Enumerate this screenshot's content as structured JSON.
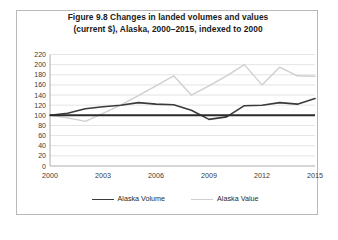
{
  "figure": {
    "title_line1": "Figure 9.8 Changes in landed volumes and values",
    "title_line2": "(current $), Alaska, 2000–2015, indexed to 2000"
  },
  "colors": {
    "volume_line": "#3b3b3b",
    "value_line": "#cfcfcf",
    "baseline": "#2b2b2b",
    "gridline": "#d8d8d8",
    "axis": "#9a9a9a",
    "frame": "#b9b9b9",
    "text": "#2a2a2a"
  },
  "legend": {
    "position": "bottom",
    "items": [
      {
        "label": "Alaska Volume",
        "color": "#3b3b3b",
        "width": 1.6
      },
      {
        "label": "Alaska Value",
        "color": "#cfcfcf",
        "width": 1.6
      }
    ]
  },
  "chart_data": {
    "type": "line",
    "title": "Figure 9.8 Changes in landed volumes and values (current $), Alaska, 2000–2015, indexed to 2000",
    "xlabel": "",
    "ylabel": "",
    "x": [
      2000,
      2001,
      2002,
      2003,
      2004,
      2005,
      2006,
      2007,
      2008,
      2009,
      2010,
      2011,
      2012,
      2013,
      2014,
      2015
    ],
    "xlim": [
      2000,
      2015
    ],
    "xticks": [
      2000,
      2003,
      2006,
      2009,
      2012,
      2015
    ],
    "xtick_labels": [
      "2000",
      "2003",
      "2006",
      "2009",
      "2012",
      "2015"
    ],
    "ylim": [
      0,
      220
    ],
    "yticks": [
      0,
      20,
      40,
      60,
      80,
      100,
      120,
      140,
      160,
      180,
      200,
      220
    ],
    "ytick_labels": [
      "0",
      "20",
      "40",
      "60",
      "80",
      "100",
      "120",
      "140",
      "160",
      "180",
      "200",
      "220"
    ],
    "grid": true,
    "reference_line": 100,
    "series": [
      {
        "name": "Alaska Volume",
        "color": "#3b3b3b",
        "values": [
          100,
          104,
          113,
          117,
          120,
          125,
          122,
          121,
          110,
          92,
          97,
          119,
          120,
          125,
          122,
          133
        ]
      },
      {
        "name": "Alaska Value",
        "color": "#cfcfcf",
        "values": [
          100,
          95,
          88,
          104,
          120,
          139,
          158,
          178,
          140,
          158,
          178,
          200,
          160,
          195,
          178,
          177
        ]
      }
    ]
  }
}
